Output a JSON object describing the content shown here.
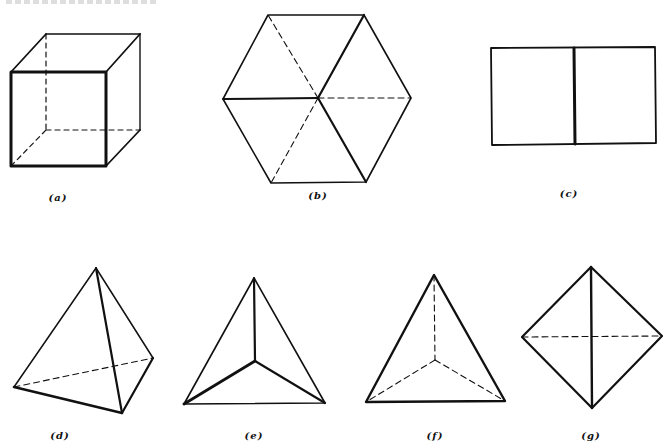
{
  "figure": {
    "line_color": "#111111",
    "panels": [
      {
        "id": "a",
        "label": "(a)",
        "shape": "cube",
        "label_pos": [
          58,
          192
        ]
      },
      {
        "id": "b",
        "label": "(b)",
        "shape": "hexagon-cube-projection",
        "label_pos": [
          318,
          190
        ]
      },
      {
        "id": "c",
        "label": "(c)",
        "shape": "square-face-projection",
        "label_pos": [
          569,
          188
        ]
      },
      {
        "id": "d",
        "label": "(d)",
        "shape": "tetrahedron",
        "label_pos": [
          60,
          430
        ]
      },
      {
        "id": "e",
        "label": "(e)",
        "shape": "tetrahedron-top-view-solid",
        "label_pos": [
          254,
          430
        ]
      },
      {
        "id": "f",
        "label": "(f)",
        "shape": "tetrahedron-top-view-hidden",
        "label_pos": [
          435,
          430
        ]
      },
      {
        "id": "g",
        "label": "(g)",
        "shape": "tetrahedron-edge-view",
        "label_pos": [
          591,
          430
        ]
      }
    ]
  }
}
